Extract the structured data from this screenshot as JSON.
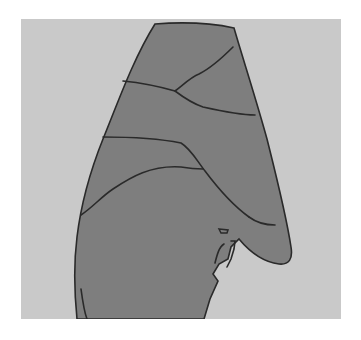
{
  "figure": {
    "colors": {
      "page_background": "#ffffff",
      "panel_background": "#c9c9c9",
      "lung_fill": "#7e7e7e",
      "lung_fill_light": "#8a8a8a",
      "outline": "#2a2a2a"
    },
    "paths": {
      "silhouette": "M134,5 C160,3 190,4 213,9 C222,40 235,80 246,120 C256,160 265,195 270,228 C272,240 268,246 258,245 C242,243 228,232 218,220 L210,228 L207,240 L198,245 L192,255 L197,262 L189,280 L183,300 L56,300 C54,280 52,250 56,218 C60,185 70,150 82,120 C96,86 112,40 134,5 Z",
      "upper_fissure_right": "M212,28 C200,40 188,50 178,55 C170,58 162,66 154,72",
      "upper_fissure_left": "M102,62 C122,64 140,68 154,72 C162,78 170,84 182,88 C200,92 218,96 234,96",
      "middle_fissure": "M82,118 C110,118 140,120 160,124 C170,130 176,142 184,152 C196,168 210,185 228,198",
      "lower_fissure": "M60,196 C72,188 80,178 92,170 C110,158 130,146 160,148 C172,150 178,150 182,150",
      "oblique_lower": "M228,198 C236,204 246,206 254,206",
      "hilum_small": "M198,210 L207,211 L206,214 L200,214 Z",
      "hilum_curve": "M203,225 C198,228 196,236 194,244",
      "hilum_edge": "M210,222 L214,222 L213,230 L210,240 L206,248",
      "left_edge_mark": "M60,270 C62,285 64,295 66,300"
    }
  }
}
